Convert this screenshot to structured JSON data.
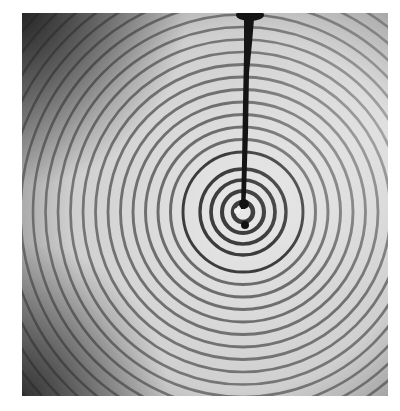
{
  "image": {
    "subject": "Concentric circular water ripples spreading from a point source, with a dark dropper/nozzle descending from the top edge",
    "colors": {
      "background": "#ffffff",
      "surface_light": "#e6e6e6",
      "surface_mid": "#b8b8b8",
      "corner_dark": "#3a3a3a",
      "ripple_dark": "#1e1e1e",
      "nozzle": "#141414"
    },
    "ripple_center": {
      "x": 243,
      "y": 212
    },
    "ripple_count": 26
  }
}
